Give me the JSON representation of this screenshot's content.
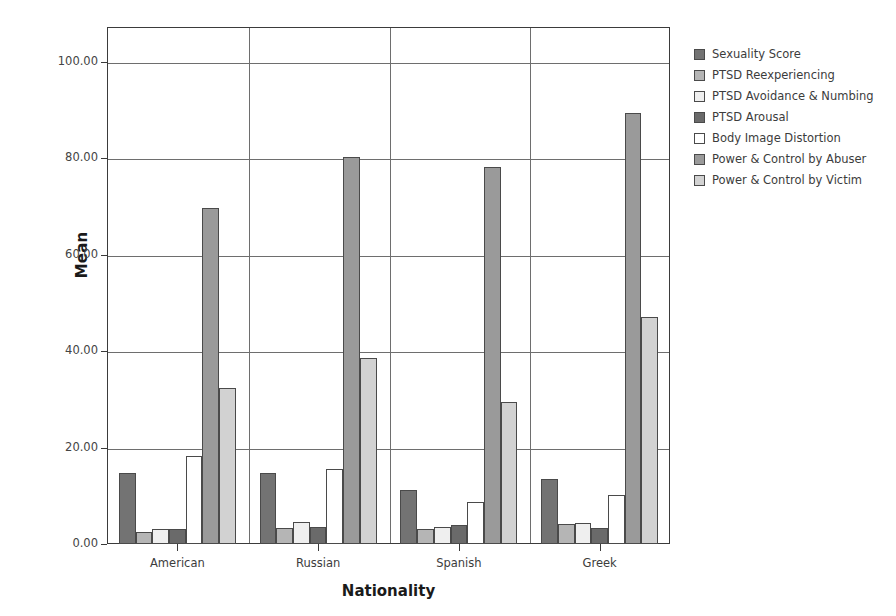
{
  "chart_data": {
    "type": "bar",
    "title": "",
    "xlabel": "Nationality",
    "ylabel": "Mean",
    "categories": [
      "American",
      "Russian",
      "Spanish",
      "Greek"
    ],
    "ylim": [
      0,
      100
    ],
    "y_ticks": [
      "0.00",
      "20.00",
      "40.00",
      "60.00",
      "80.00",
      "100.00"
    ],
    "y_tick_values": [
      0,
      20,
      40,
      60,
      80,
      100
    ],
    "grid": true,
    "legend_position": "right",
    "series": [
      {
        "name": "Sexuality Score",
        "color": "#737373",
        "values": [
          14.7,
          14.8,
          11.2,
          13.5
        ]
      },
      {
        "name": "PTSD Reexperiencing",
        "color": "#b5b5b5",
        "values": [
          2.5,
          3.3,
          3.1,
          4.2
        ]
      },
      {
        "name": "PTSD Avoidance & Numbing",
        "color": "#efefef",
        "values": [
          3.2,
          4.5,
          3.6,
          4.3
        ]
      },
      {
        "name": "PTSD Arousal",
        "color": "#6a6a6a",
        "values": [
          3.2,
          3.6,
          4.0,
          3.4
        ]
      },
      {
        "name": "Body Image Distortion",
        "color": "#ffffff",
        "values": [
          18.2,
          15.5,
          8.7,
          10.2
        ]
      },
      {
        "name": "Power & Control by Abuser",
        "color": "#9a9a9a",
        "values": [
          69.8,
          80.3,
          78.3,
          89.5
        ]
      },
      {
        "name": "Power & Control by Victim",
        "color": "#d2d2d2",
        "values": [
          32.3,
          38.6,
          29.5,
          47.0
        ]
      }
    ]
  }
}
